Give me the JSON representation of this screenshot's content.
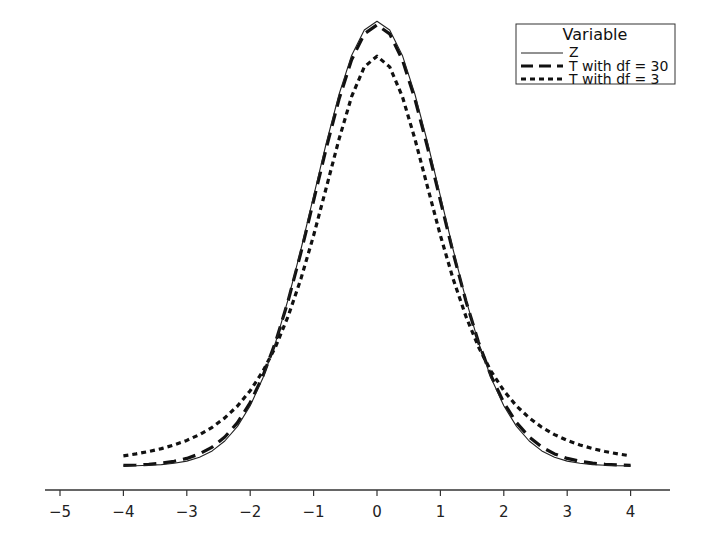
{
  "chart_data": {
    "type": "line",
    "title": "",
    "xlabel": "",
    "ylabel": "",
    "xlim": [
      -5.2,
      4.5
    ],
    "x_ticks": [
      -5,
      -4,
      -3,
      -2,
      -1,
      0,
      1,
      2,
      3,
      4
    ],
    "x_tick_labels": [
      "−5",
      "−4",
      "−3",
      "−2",
      "−1",
      "0",
      "1",
      "2",
      "3",
      "4"
    ],
    "y_axis_visible": false,
    "grid": false,
    "x_range": [
      -4,
      4
    ],
    "x_step": 0.2,
    "legend": {
      "title": "Variable",
      "position": "top-right",
      "entries": [
        "Z",
        "T with df = 30",
        "T with df = 3"
      ]
    },
    "series": [
      {
        "name": "Z",
        "style": "solid-thin",
        "df": null,
        "peak": 0.399,
        "value_at_4": 0.0001
      },
      {
        "name": "T with df = 30",
        "style": "long-dash",
        "df": 30,
        "peak": 0.396,
        "value_at_4": 0.0003
      },
      {
        "name": "T with df = 3",
        "style": "short-dash",
        "df": 3,
        "peak": 0.368,
        "value_at_4": 0.0092
      }
    ]
  }
}
